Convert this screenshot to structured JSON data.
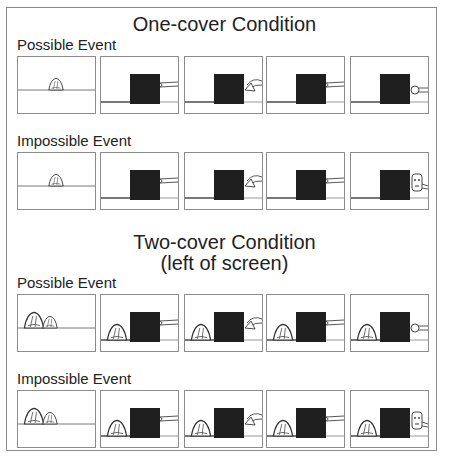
{
  "figure": {
    "sections": [
      {
        "title_lines": [
          "One-cover Condition"
        ],
        "rows": [
          {
            "label": "Possible Event",
            "panels": [
              {
                "step": 1,
                "description": "One cover on stage floor, no screen"
              },
              {
                "step": 2,
                "description": "Screen raised, hand enters from right"
              },
              {
                "step": 3,
                "description": "Hand holds cover beside screen"
              },
              {
                "step": 4,
                "description": "Hand withdrawn, empty"
              },
              {
                "step": 5,
                "description": "Hand reveals toy (hidden) at right of screen"
              }
            ]
          },
          {
            "label": "Impossible Event",
            "panels": [
              {
                "step": 1,
                "description": "One cover on stage floor, no screen"
              },
              {
                "step": 2,
                "description": "Screen raised, hand enters from right"
              },
              {
                "step": 3,
                "description": "Hand holds cover beside screen"
              },
              {
                "step": 4,
                "description": "Hand withdrawn, empty"
              },
              {
                "step": 5,
                "description": "Hand holds toy at right of screen"
              }
            ]
          }
        ]
      },
      {
        "title_lines": [
          "Two-cover Condition",
          "(left of screen)"
        ],
        "rows": [
          {
            "label": "Possible Event",
            "panels": [
              {
                "step": 1,
                "description": "Two covers on stage floor, no screen"
              },
              {
                "step": 2,
                "description": "Left cover stays, screen raised, hand enters"
              },
              {
                "step": 3,
                "description": "Hand holds cover beside screen"
              },
              {
                "step": 4,
                "description": "Hand withdrawn, empty"
              },
              {
                "step": 5,
                "description": "Hand reveals toy (hidden) at right of screen"
              }
            ]
          },
          {
            "label": "Impossible Event",
            "panels": [
              {
                "step": 1,
                "description": "Two covers on stage floor, no screen"
              },
              {
                "step": 2,
                "description": "Left cover stays, screen raised, hand enters"
              },
              {
                "step": 3,
                "description": "Hand holds cover beside screen"
              },
              {
                "step": 4,
                "description": "Hand withdrawn, empty"
              },
              {
                "step": 5,
                "description": "Hand holds toy at right of screen"
              }
            ]
          }
        ]
      }
    ]
  },
  "colors": {
    "screen": "#1f1f1f",
    "line": "#555555",
    "border": "#8c8c8c"
  }
}
